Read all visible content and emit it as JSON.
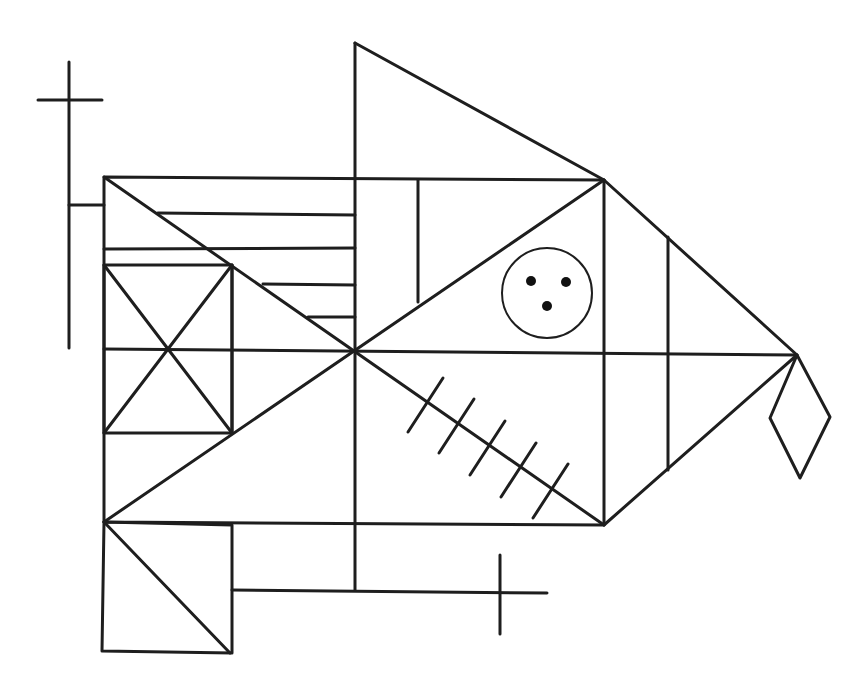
{
  "figure": {
    "name": "Rey-Osterrieth Complex Figure",
    "stroke_color": "#1e1e1e",
    "background_color": "#ffffff",
    "components": [
      "large-rectangle",
      "diagonal-cross",
      "vertical-midline",
      "horizontal-midline",
      "top-triangle",
      "right-triangle",
      "diamond",
      "left-cross",
      "small-square-with-x",
      "parallel-lines",
      "bottom-square",
      "bottom-cross",
      "circle-with-three-dots",
      "five-hatch-marks",
      "vertical-line-in-upper-right",
      "vertical-line-in-right-triangle"
    ],
    "hatch_mark_count": 5,
    "dot_count": 3
  }
}
